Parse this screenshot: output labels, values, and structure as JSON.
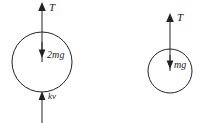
{
  "figure": {
    "background_color": "#ffffff",
    "ink_color": "#222222",
    "width": 200,
    "height": 123,
    "bodies": [
      {
        "id": "left-body",
        "name": "left-mass-circle",
        "center_x": 42,
        "center_y": 62,
        "radius": 30,
        "forces": [
          {
            "id": "left-tension",
            "name": "tension-force",
            "label": "T",
            "direction": "up",
            "label_x": 49,
            "label_y": 2
          },
          {
            "id": "left-weight",
            "name": "weight-force",
            "label": "2mg",
            "direction": "down",
            "label_x": 47,
            "label_y": 50
          },
          {
            "id": "left-drag",
            "name": "drag-force",
            "label": "kv",
            "direction": "up",
            "label_x": 48,
            "label_y": 92
          }
        ]
      },
      {
        "id": "right-body",
        "name": "right-mass-circle",
        "center_x": 170,
        "center_y": 71,
        "radius": 22,
        "forces": [
          {
            "id": "right-tension",
            "name": "tension-force",
            "label": "T",
            "direction": "up",
            "label_x": 177,
            "label_y": 12
          },
          {
            "id": "right-weight",
            "name": "weight-force",
            "label": "mg",
            "direction": "down",
            "label_x": 174,
            "label_y": 60
          }
        ]
      }
    ]
  }
}
